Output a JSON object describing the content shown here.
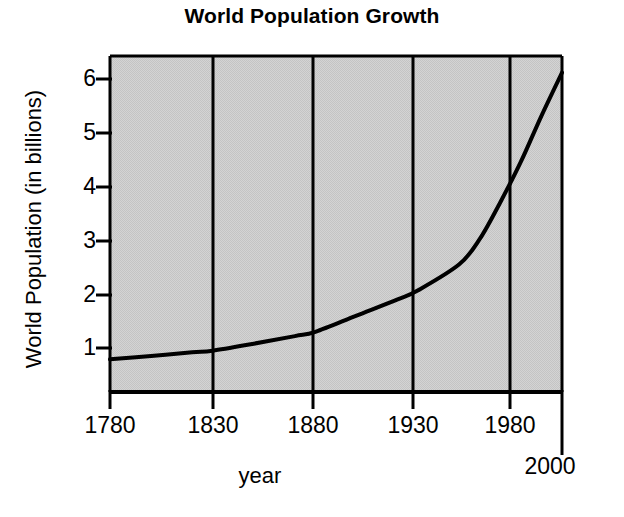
{
  "chart_data": {
    "type": "line",
    "title": "World Population Growth",
    "xlabel": "year",
    "ylabel": "World Population (in billions)",
    "xlim": [
      1780,
      2000
    ],
    "ylim": [
      0,
      6.4
    ],
    "grid": "vertical-only",
    "legend": null,
    "x_tick_labels": [
      "1780",
      "1830",
      "1880",
      "1930",
      "1980"
    ],
    "x_tick_values": [
      1780,
      1830,
      1880,
      1930,
      1980
    ],
    "x_end_tick_label": "2000",
    "x_end_tick_value": 2000,
    "y_tick_labels": [
      "1",
      "2",
      "3",
      "4",
      "5",
      "6"
    ],
    "y_tick_values": [
      1,
      2,
      3,
      4,
      5,
      6
    ],
    "series": [
      {
        "name": "World population",
        "x": [
          1780,
          1800,
          1820,
          1830,
          1850,
          1870,
          1880,
          1900,
          1920,
          1930,
          1950,
          1960,
          1970,
          1980,
          1990,
          2000
        ],
        "y": [
          0.79,
          0.85,
          0.92,
          0.95,
          1.08,
          1.22,
          1.3,
          1.6,
          1.9,
          2.07,
          2.55,
          3.02,
          3.7,
          4.45,
          5.3,
          6.1
        ],
        "color": "#000000",
        "linewidth": 4
      }
    ],
    "plot_background": "#d2d2d2",
    "axis_color": "#000000"
  },
  "figure": {
    "background": "#ffffff",
    "width": 624,
    "height": 517
  }
}
